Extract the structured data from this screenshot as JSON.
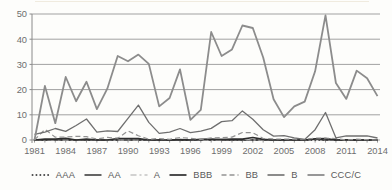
{
  "chart_data": {
    "type": "line",
    "title": "",
    "xlabel": "",
    "ylabel": "",
    "ylim": [
      0,
      50
    ],
    "grid": true,
    "legend_position": "bottom",
    "axis_color": "#8a8a8a",
    "grid_color": "#a1a1a1",
    "tick_label_color": "#6e6e6e",
    "legend_text_color": "#5a5a5a",
    "y_ticks": [
      "0",
      "10",
      "20",
      "30",
      "40",
      "50"
    ],
    "x_tick_labels": [
      "1981",
      "1984",
      "1987",
      "1990",
      "1993",
      "1996",
      "1999",
      "2002",
      "2005",
      "2008",
      "2011",
      "2014"
    ],
    "x": [
      1981,
      1982,
      1983,
      1984,
      1985,
      1986,
      1987,
      1988,
      1989,
      1990,
      1991,
      1992,
      1993,
      1994,
      1995,
      1996,
      1997,
      1998,
      1999,
      2000,
      2001,
      2002,
      2003,
      2004,
      2005,
      2006,
      2007,
      2008,
      2009,
      2010,
      2011,
      2012,
      2013,
      2014
    ],
    "series": [
      {
        "name": "AAA",
        "line_style": "dotted",
        "color": "#4a4a4a",
        "width": 1.9,
        "dash": "0.1,3.8",
        "linecap": "round",
        "values": [
          0,
          0,
          0,
          0,
          0,
          0,
          0,
          0,
          0,
          0,
          0,
          0,
          0,
          0,
          0,
          0,
          0,
          0,
          0,
          0,
          0,
          0,
          0,
          0,
          0,
          0,
          0,
          0,
          0,
          0,
          0,
          0,
          0,
          0
        ]
      },
      {
        "name": "AA",
        "line_style": "solid",
        "color": "#3f3f3f",
        "width": 1.6,
        "dash": "",
        "linecap": "",
        "values": [
          0,
          0,
          0,
          0,
          0,
          0,
          0,
          0,
          0,
          0,
          0,
          0,
          0,
          0,
          0,
          0,
          0,
          0,
          0.17,
          0,
          0,
          0,
          0,
          0,
          0,
          0,
          0,
          0.38,
          0,
          0,
          0,
          0,
          0,
          0
        ]
      },
      {
        "name": "A",
        "line_style": "dashed",
        "color": "#c3c3c3",
        "width": 1.2,
        "dash": "6,3,2,3",
        "linecap": "",
        "values": [
          0,
          0.21,
          0,
          0,
          0,
          0.14,
          0,
          0,
          0,
          0,
          0,
          0,
          0,
          0.14,
          0,
          0,
          0,
          0,
          0.1,
          0.27,
          0.27,
          0,
          0,
          0.08,
          0,
          0,
          0,
          0.39,
          0.22,
          0,
          0,
          0,
          0.11,
          0
        ]
      },
      {
        "name": "BBB",
        "line_style": "solid",
        "color": "#2e2e2e",
        "width": 1.7,
        "dash": "",
        "linecap": "",
        "values": [
          0,
          0.34,
          0.32,
          0.66,
          0,
          0.33,
          0,
          0,
          0.6,
          0.58,
          0.55,
          0,
          0,
          0,
          0.17,
          0,
          0.25,
          0.41,
          0.2,
          0.37,
          0.34,
          1.01,
          0.23,
          0,
          0.07,
          0,
          0,
          0.49,
          0.55,
          0,
          0.07,
          0,
          0,
          0
        ]
      },
      {
        "name": "BB",
        "line_style": "dashed",
        "color": "#929292",
        "width": 1.2,
        "dash": "5,3",
        "linecap": "",
        "values": [
          0,
          4.22,
          1.12,
          1.14,
          1.48,
          1.31,
          0.38,
          1.05,
          0.7,
          3.56,
          1.68,
          0.3,
          0.58,
          0.27,
          0.99,
          0.67,
          0.19,
          0.82,
          0.95,
          1.16,
          2.96,
          2.89,
          0.58,
          0.44,
          0.31,
          0.3,
          0.2,
          0.81,
          0.75,
          0.58,
          0,
          0.3,
          0.1,
          0
        ]
      },
      {
        "name": "B",
        "line_style": "solid",
        "color": "#6f6f6f",
        "width": 1.3,
        "dash": "",
        "linecap": "",
        "values": [
          2.27,
          3.13,
          4.58,
          3.41,
          5.75,
          8.33,
          3.08,
          3.63,
          3.38,
          8.56,
          13.84,
          6.99,
          2.62,
          3.08,
          4.58,
          2.91,
          3.49,
          4.62,
          7.29,
          7.67,
          11.53,
          8.21,
          4.07,
          1.56,
          1.74,
          0.82,
          0.25,
          4.09,
          10.92,
          0.86,
          1.67,
          1.57,
          1.64,
          0.78
        ]
      },
      {
        "name": "CCC/C",
        "line_style": "solid",
        "color": "#8c8c8c",
        "width": 1.8,
        "dash": "",
        "linecap": "",
        "values": [
          0,
          21.43,
          6.67,
          25.0,
          15.38,
          23.08,
          12.28,
          20.37,
          33.33,
          31.25,
          33.87,
          30.19,
          13.33,
          16.67,
          28.0,
          8.0,
          12.0,
          42.86,
          33.33,
          35.96,
          45.45,
          44.44,
          32.73,
          16.18,
          9.09,
          13.33,
          15.24,
          27.27,
          49.46,
          22.62,
          16.3,
          27.52,
          24.5,
          17.42
        ]
      }
    ]
  }
}
